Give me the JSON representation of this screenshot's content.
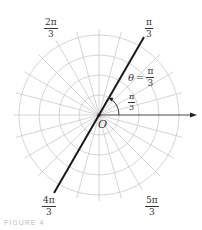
{
  "diagram": {
    "type": "polar-grid",
    "center": {
      "x": 99,
      "y": 115
    },
    "origin_label": "O",
    "circle_radii": [
      20,
      40,
      60,
      80
    ],
    "ray_step_degrees": 15,
    "ray_length": 86,
    "grid_color": "#c9c9c9",
    "line_color": "#1a1a1a",
    "polar_axis": {
      "from_x": 99,
      "to_x": 197,
      "y": 115
    },
    "highlighted_line": {
      "angle_label": "θ = π/3",
      "angle_degrees": 60,
      "half_length": 90
    }
  },
  "labels": {
    "pi_over_3_top": {
      "num": "π",
      "den": "3"
    },
    "two_pi_over_3": {
      "num": "2π",
      "den": "3"
    },
    "four_pi_over_3": {
      "num": "4π",
      "den": "3"
    },
    "five_pi_over_3": {
      "num": "5π",
      "den": "3"
    },
    "theta_equation": {
      "lhs": "θ",
      "eq": "=",
      "num": "π",
      "den": "3"
    },
    "angle_arc": {
      "num": "π",
      "den": "3"
    },
    "origin": "O"
  },
  "caption": "FIGURE 4"
}
